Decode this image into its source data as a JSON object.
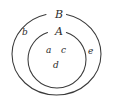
{
  "figure": {
    "type": "euler-diagram",
    "background_color": "#ffffff",
    "stroke_color": "#3a3a3a",
    "text_color": "#2b2b2b"
  },
  "sets": [
    {
      "id": "B",
      "label": "B",
      "role": "outer-set",
      "shape": "ellipse",
      "center": [
        56.5,
        54
      ],
      "radius_x": 44.5,
      "radius_y": 41,
      "label_position": [
        55,
        9
      ],
      "label_gap_on_boundary": true
    },
    {
      "id": "A",
      "label": "A",
      "role": "inner-set",
      "shape": "ellipse",
      "center": [
        57,
        59.5
      ],
      "radius_x": 29,
      "radius_y": 28.5,
      "label_position": [
        55,
        26
      ],
      "label_gap_on_boundary": true
    }
  ],
  "elements": [
    {
      "label": "b",
      "region": "B-only",
      "position": [
        22,
        28
      ]
    },
    {
      "label": "e",
      "region": "B-only",
      "position": [
        88,
        47
      ]
    },
    {
      "label": "a",
      "region": "A",
      "position": [
        46,
        46
      ]
    },
    {
      "label": "c",
      "region": "A",
      "position": [
        61,
        46
      ]
    },
    {
      "label": "d",
      "region": "A",
      "position": [
        53,
        61
      ]
    }
  ]
}
